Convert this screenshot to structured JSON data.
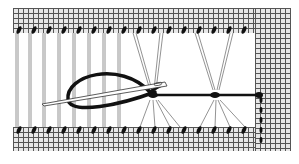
{
  "illustration": {
    "subject": "hemstitch embroidery on evenweave fabric with needle and thread",
    "elements": [
      "fabric-grid-top",
      "fabric-grid-bottom",
      "fabric-grid-right",
      "vertical-threads",
      "thread-bundles",
      "needle",
      "working-thread",
      "stitches"
    ],
    "colors": {
      "grid": "#555555",
      "fabric": "#e8e8e8",
      "thread": "#1a1a1a",
      "background": "#ffffff"
    }
  }
}
